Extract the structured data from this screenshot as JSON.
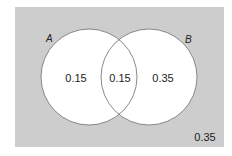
{
  "diagram": {
    "type": "venn",
    "colors": {
      "universe_fill": "#cdcdcd",
      "circle_fill": "#ffffff",
      "circle_stroke": "#7a7a7a",
      "text": "#222222"
    },
    "sets": [
      {
        "name": "A",
        "label": "A"
      },
      {
        "name": "B",
        "label": "B"
      }
    ],
    "regions": {
      "a_only": "0.15",
      "a_and_b": "0.15",
      "b_only": "0.35",
      "neither": "0.35"
    }
  }
}
